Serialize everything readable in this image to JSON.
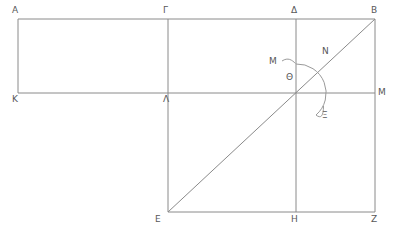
{
  "figure": {
    "kind": "geometry-diagram",
    "stroke_color": "#8a8a8a",
    "label_color": "#585858",
    "background": "#ffffff",
    "width": 393,
    "height": 235
  },
  "labels": [
    {
      "id": "A",
      "text": "Α",
      "x": 12,
      "y": 6
    },
    {
      "id": "Gamma",
      "text": "Γ",
      "x": 163,
      "y": 6
    },
    {
      "id": "Delta",
      "text": "Δ",
      "x": 291,
      "y": 6
    },
    {
      "id": "B",
      "text": "Β",
      "x": 371,
      "y": 6
    },
    {
      "id": "K",
      "text": "Κ",
      "x": 12,
      "y": 95
    },
    {
      "id": "Lambda",
      "text": "Λ",
      "x": 163,
      "y": 95
    },
    {
      "id": "M_end",
      "text": "Μ",
      "x": 378,
      "y": 88
    },
    {
      "id": "Theta",
      "text": "Θ",
      "x": 286,
      "y": 73
    },
    {
      "id": "M_arc",
      "text": "Μ",
      "x": 269,
      "y": 57
    },
    {
      "id": "N",
      "text": "Ν",
      "x": 322,
      "y": 47
    },
    {
      "id": "Xi",
      "text": "Ξ",
      "x": 322,
      "y": 111
    },
    {
      "id": "E",
      "text": "Ε",
      "x": 155,
      "y": 215
    },
    {
      "id": "H",
      "text": "Η",
      "x": 291,
      "y": 215
    },
    {
      "id": "Z",
      "text": "Ζ",
      "x": 371,
      "y": 215
    }
  ],
  "geometry": {
    "points": {
      "A": {
        "x": 18,
        "y": 19
      },
      "Gamma": {
        "x": 168,
        "y": 19
      },
      "Delta": {
        "x": 296,
        "y": 19
      },
      "B": {
        "x": 375,
        "y": 19
      },
      "K": {
        "x": 18,
        "y": 93
      },
      "Lambda": {
        "x": 168,
        "y": 93
      },
      "Theta": {
        "x": 296,
        "y": 93
      },
      "M": {
        "x": 375,
        "y": 93
      },
      "E": {
        "x": 168,
        "y": 212
      },
      "H": {
        "x": 296,
        "y": 212
      },
      "Z": {
        "x": 375,
        "y": 212
      }
    },
    "segments": [
      {
        "name": "top-edge-A-B",
        "d": "M 18 19 L 375 19"
      },
      {
        "name": "mid-edge-K-M",
        "d": "M 18 93 L 375 93"
      },
      {
        "name": "bottom-edge-E-Z",
        "d": "M 168 212 L 375 212"
      },
      {
        "name": "left-edge-A-K",
        "d": "M 18 19 L 18 93"
      },
      {
        "name": "vertical-Gamma-E",
        "d": "M 168 19 L 168 212"
      },
      {
        "name": "vertical-Delta-H",
        "d": "M 296 19 L 296 212"
      },
      {
        "name": "right-edge-B-Z",
        "d": "M 375 19 L 375 212"
      },
      {
        "name": "diagonal-E-B",
        "d": "M 168 212 L 375 19"
      }
    ],
    "arc": {
      "name": "angle-arc-at-Theta",
      "center": {
        "x": 296,
        "y": 93
      },
      "radius": 29,
      "d": "M 296 64 A 29 29 0 0 1 316 115"
    },
    "leaders": [
      {
        "name": "leader-to-M-arc",
        "d": "M 282 61 C 288 58 292 60 295 64"
      },
      {
        "name": "leader-to-Xi",
        "d": "M 316 115 C 320 120 321 122 323 105"
      }
    ]
  }
}
